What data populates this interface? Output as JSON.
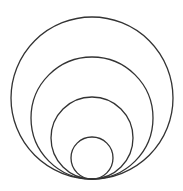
{
  "diagram": {
    "stroke_color": "#333333",
    "background": "#ffffff",
    "tangent_point": {
      "x": 92,
      "y": 179
    },
    "circles": [
      {
        "cx": 92,
        "cy": 98,
        "r": 81
      },
      {
        "cx": 92,
        "cy": 118,
        "r": 61
      },
      {
        "cx": 92,
        "cy": 138,
        "r": 41
      },
      {
        "cx": 92,
        "cy": 158,
        "r": 21
      }
    ]
  }
}
